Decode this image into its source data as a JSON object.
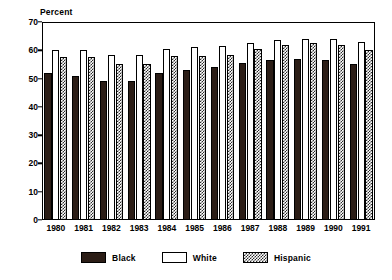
{
  "chart_data": {
    "type": "bar",
    "title": "",
    "subtitle": "",
    "xlabel": "",
    "ylabel": "Percent",
    "ylim": [
      0,
      70
    ],
    "yticks": [
      0,
      10,
      20,
      30,
      40,
      50,
      60,
      70
    ],
    "grid": false,
    "legend_position": "bottom",
    "categories": [
      "1980",
      "1981",
      "1982",
      "1983",
      "1984",
      "1985",
      "1986",
      "1987",
      "1988",
      "1989",
      "1990",
      "1991"
    ],
    "series": [
      {
        "name": "Black",
        "style": "solid-dark",
        "color": "#2b1d16",
        "values": [
          52,
          51,
          49,
          49,
          52,
          53,
          54,
          55.5,
          56.5,
          57,
          56.5,
          55
        ]
      },
      {
        "name": "White",
        "style": "outline",
        "color": "#ffffff",
        "values": [
          60,
          60,
          58.5,
          58.5,
          60.5,
          61,
          61.5,
          62.5,
          63.5,
          64,
          64,
          63
        ]
      },
      {
        "name": "Hispanic",
        "style": "hatched",
        "color": "#2b2b2b",
        "values": [
          57.5,
          57.5,
          55,
          55,
          58,
          58,
          58.5,
          60.5,
          62,
          62.5,
          62,
          60
        ]
      }
    ]
  },
  "axis": {
    "y_unit_label": "Percent",
    "tick_labels": [
      "70",
      "60",
      "50",
      "40",
      "30",
      "20",
      "10",
      "0"
    ]
  },
  "legend": {
    "items": [
      {
        "label": "Black",
        "swatch": "solid-dark-swatch"
      },
      {
        "label": "White",
        "swatch": "outline-swatch"
      },
      {
        "label": "Hispanic",
        "swatch": "hatched-swatch"
      }
    ]
  }
}
